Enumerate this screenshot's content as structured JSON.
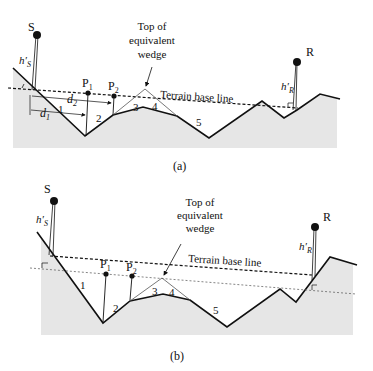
{
  "figure": {
    "panel_a": {
      "caption": "(a)",
      "labels": {
        "transmitter": "S",
        "receiver": "R",
        "hs": "h′",
        "hs_sub": "S",
        "hr": "h′",
        "hr_sub": "R",
        "p1": "P",
        "p1_sub": "1",
        "p2": "P",
        "p2_sub": "2",
        "d1": "d",
        "d1_sub": "1",
        "d2": "d",
        "d2_sub": "2",
        "wedge_line1": "Top of",
        "wedge_line2": "equivalent",
        "wedge_line3": "wedge",
        "base_line": "Terrain base line",
        "seg1": "1",
        "seg2": "2",
        "seg3": "3",
        "seg4": "4",
        "seg5": "5"
      }
    },
    "panel_b": {
      "caption": "(b)",
      "labels": {
        "transmitter": "S",
        "receiver": "R",
        "hs": "h′",
        "hs_sub": "S",
        "hr": "h′",
        "hr_sub": "R",
        "p1": "P",
        "p1_sub": "1",
        "p2": "P",
        "p2_sub": "2",
        "wedge_line1": "Top of",
        "wedge_line2": "equivalent",
        "wedge_line3": "wedge",
        "base_line": "Terrain base line",
        "seg1": "1",
        "seg2": "2",
        "seg3": "3",
        "seg4": "4",
        "seg5": "5"
      }
    },
    "colors": {
      "terrain_fill": "#e6e6e6",
      "line": "#111111"
    }
  }
}
